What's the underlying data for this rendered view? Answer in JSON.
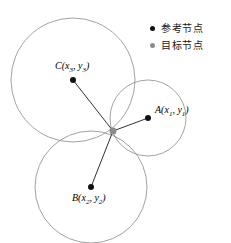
{
  "figure": {
    "title_fragment": "",
    "background": "#ffffff"
  },
  "legend": {
    "items": [
      {
        "label": "参考节点",
        "color": "#111111",
        "icon": "filled-circle-icon"
      },
      {
        "label": "目标节点",
        "color": "#8c8c8c",
        "icon": "filled-circle-icon"
      }
    ]
  },
  "nodes": [
    {
      "id": "A",
      "label_letter": "A",
      "label_open": "(",
      "label_x": "x",
      "label_x_sub": "1",
      "label_sep": ", ",
      "label_y": "y",
      "label_y_sub": "1",
      "label_close": ")",
      "type": "reference"
    },
    {
      "id": "B",
      "label_letter": "B",
      "label_open": "(",
      "label_x": "x",
      "label_x_sub": "2",
      "label_sep": ", ",
      "label_y": "y",
      "label_y_sub": "2",
      "label_close": ")",
      "type": "reference"
    },
    {
      "id": "C",
      "label_letter": "C",
      "label_open": "(",
      "label_x": "x",
      "label_x_sub": "3",
      "label_sep": ", ",
      "label_y": "y",
      "label_y_sub": "3",
      "label_close": ")",
      "type": "reference"
    }
  ],
  "chart_data": {
    "type": "scatter",
    "title": "",
    "xlabel": "",
    "ylabel": "",
    "grid": false,
    "legend_position": "top-right",
    "circles": [
      {
        "node": "C",
        "cx": 73,
        "cy": 80,
        "r": 62,
        "stroke": "#8a8a8a"
      },
      {
        "node": "A",
        "cx": 148,
        "cy": 118,
        "r": 38,
        "stroke": "#8a8a8a"
      },
      {
        "node": "B",
        "cx": 91,
        "cy": 187,
        "r": 56,
        "stroke": "#8a8a8a"
      }
    ],
    "points": [
      {
        "name": "A",
        "x": 148,
        "y": 118,
        "kind": "reference",
        "color": "#111111",
        "r": 3
      },
      {
        "name": "B",
        "x": 91,
        "y": 187,
        "kind": "reference",
        "color": "#111111",
        "r": 3
      },
      {
        "name": "C",
        "x": 73,
        "y": 80,
        "kind": "reference",
        "color": "#111111",
        "r": 3
      },
      {
        "name": "target",
        "x": 113,
        "y": 131,
        "kind": "target",
        "color": "#8c8c8c",
        "r": 3.5
      }
    ],
    "radius_lines": [
      {
        "from": "A",
        "to": "target",
        "x1": 148,
        "y1": 118,
        "x2": 113,
        "y2": 131
      },
      {
        "from": "B",
        "to": "target",
        "x1": 91,
        "y1": 187,
        "x2": 113,
        "y2": 131
      },
      {
        "from": "C",
        "to": "target",
        "x1": 73,
        "y1": 80,
        "x2": 113,
        "y2": 131
      }
    ]
  }
}
